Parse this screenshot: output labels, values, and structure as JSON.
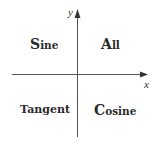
{
  "diagram": {
    "type": "quadrant-sign-diagram",
    "axes": {
      "x_label": "x",
      "y_label": "y",
      "color": "#555555"
    },
    "quadrants": {
      "q1": {
        "position": "top-right",
        "initial": "A",
        "rest": "ll",
        "full": "All"
      },
      "q2": {
        "position": "top-left",
        "initial": "S",
        "rest": "ine",
        "full": "Sine"
      },
      "q3": {
        "position": "bottom-left",
        "text": "Tangent"
      },
      "q4": {
        "position": "bottom-right",
        "initial": "C",
        "rest": "osine",
        "full": "Cosine"
      }
    },
    "text_color": "#2a2a2a"
  }
}
